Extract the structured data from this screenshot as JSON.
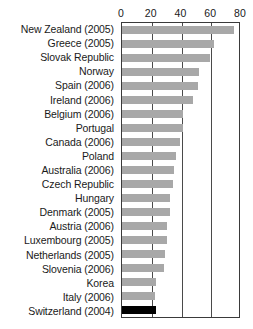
{
  "chart_data": {
    "type": "bar",
    "orientation": "horizontal",
    "title": "",
    "xlabel": "",
    "ylabel": "",
    "xlim": [
      0,
      80
    ],
    "xticks": [
      0,
      20,
      40,
      60,
      80
    ],
    "grid": true,
    "legend": null,
    "categories": [
      "New Zealand (2005)",
      "Greece (2005)",
      "Slovak Republic",
      "Norway",
      "Spain (2006)",
      "Ireland (2006)",
      "Belgium (2006)",
      "Portugal",
      "Canada (2006)",
      "Poland",
      "Australia (2006)",
      "Czech Republic",
      "Hungary",
      "Denmark (2005)",
      "Austria (2006)",
      "Luxembourg (2005)",
      "Netherlands (2005)",
      "Slovenia (2006)",
      "Korea",
      "Italy (2006)",
      "Switzerland (2004)"
    ],
    "values": [
      75,
      62,
      59,
      52,
      51,
      48,
      41,
      41,
      39,
      36,
      35,
      34,
      32,
      32,
      30,
      30,
      29,
      28,
      23,
      22,
      23
    ],
    "highlight_category": "Switzerland (2004)",
    "colors": {
      "bar": "#a8a8a8",
      "highlight_bar": "#000000",
      "axis": "#3a3a3a",
      "gridline": "#4a4a4a",
      "text": "#1a1a1a"
    }
  },
  "caption": ""
}
